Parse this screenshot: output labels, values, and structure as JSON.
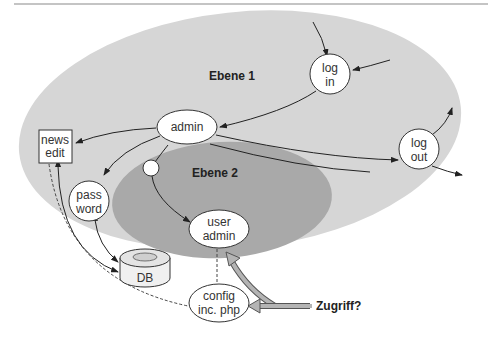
{
  "colors": {
    "zone1": "#d6d6d6",
    "zone2": "#a9a9a9",
    "rule": "#8a8a8a",
    "node_fill": "#ffffff",
    "stroke": "#222222",
    "arrow_fill": "#b4b4b4"
  },
  "zones": {
    "ebene1": "Ebene 1",
    "ebene2": "Ebene 2"
  },
  "nodes": {
    "login": {
      "line1": "log",
      "line2": "in"
    },
    "admin": {
      "label": "admin"
    },
    "logout": {
      "line1": "log",
      "line2": "out"
    },
    "news_edit": {
      "line1": "news",
      "line2": "edit"
    },
    "password": {
      "line1": "pass",
      "line2": "word"
    },
    "db": {
      "label": "DB"
    },
    "user_admin": {
      "line1": "user",
      "line2": "admin"
    },
    "config": {
      "line1": "config",
      "line2": "inc. php"
    }
  },
  "annotation": {
    "access_question": "Zugriff?"
  }
}
